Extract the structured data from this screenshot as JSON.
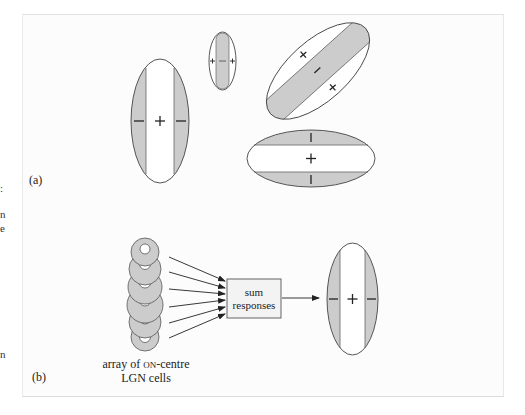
{
  "figure": {
    "panel_a": {
      "label": "(a)",
      "receptive_fields": [
        {
          "name": "vertical-large",
          "centre_sign": "+",
          "flank_sign": "−",
          "orientation_deg": 90
        },
        {
          "name": "vertical-narrow",
          "centre_sign": "−",
          "flank_sign": "+",
          "orientation_deg": 90
        },
        {
          "name": "oblique",
          "centre_sign": "−",
          "flank_sign": "×",
          "orientation_deg": 45
        },
        {
          "name": "horizontal",
          "centre_sign": "+",
          "flank_sign": "|",
          "orientation_deg": 0
        }
      ]
    },
    "panel_b": {
      "label": "(b)",
      "lgn_array_caption_line1_prefix": "array of ",
      "lgn_array_caption_smallcaps": "on",
      "lgn_array_caption_line1_suffix": "-centre",
      "lgn_array_caption_line2": "LGN cells",
      "lgn_cell_count": 6,
      "sum_box_line1": "sum",
      "sum_box_line2": "responses",
      "output_field": {
        "centre_sign": "+",
        "flank_sign": "−"
      }
    },
    "symbols": {
      "plus": "+",
      "minus": "−",
      "cross": "×"
    },
    "colors": {
      "shaded": "#cccccc",
      "stroke": "#444444",
      "panel_bg": "#fcfcfc"
    }
  },
  "edge_fragments": [
    ":",
    "n",
    "e",
    "n"
  ]
}
